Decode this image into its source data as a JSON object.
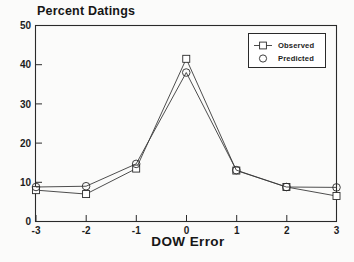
{
  "chart_data": {
    "type": "line",
    "title": "Percent Datings",
    "xlabel": "DOW Error",
    "ylabel": "",
    "x": [
      -3,
      -2,
      -1,
      0,
      1,
      2,
      3
    ],
    "xticklabels": [
      "-3",
      "-2",
      "-1",
      "0",
      "1",
      "2",
      "3"
    ],
    "yticklabels": [
      "0",
      "10",
      "20",
      "30",
      "40",
      "50"
    ],
    "yticks": [
      0,
      10,
      20,
      30,
      40,
      50
    ],
    "xlim": [
      -3,
      3
    ],
    "ylim": [
      0,
      50
    ],
    "grid": false,
    "legend_position": "top-right",
    "series": [
      {
        "name": "Observed",
        "marker": "square",
        "values": [
          8.0,
          7.0,
          13.5,
          41.5,
          13.0,
          8.8,
          6.5
        ]
      },
      {
        "name": "Predicted",
        "marker": "circle",
        "values": [
          8.8,
          9.0,
          14.7,
          38.0,
          13.1,
          8.8,
          8.7
        ]
      }
    ]
  },
  "legend": {
    "observed_label": "Observed",
    "predicted_label": "Predicted"
  }
}
